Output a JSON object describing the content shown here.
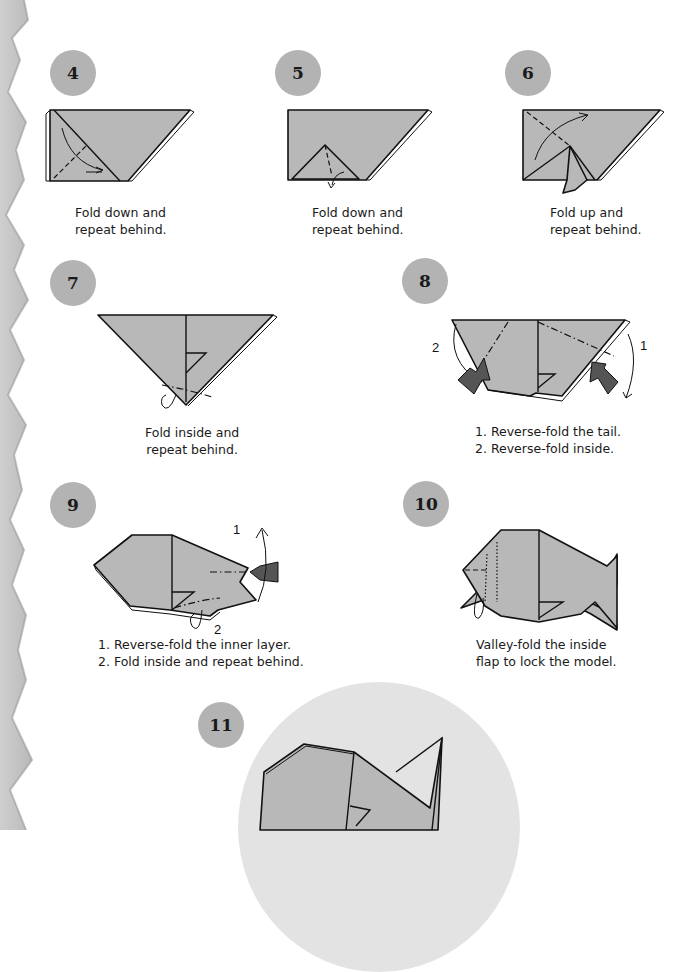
{
  "steps": [
    {
      "number": "4",
      "caption": [
        "Fold down and",
        "repeat behind."
      ]
    },
    {
      "number": "5",
      "caption": [
        "Fold down and",
        "repeat behind."
      ]
    },
    {
      "number": "6",
      "caption": [
        "Fold up and",
        "repeat behind."
      ]
    },
    {
      "number": "7",
      "caption": [
        "Fold inside and",
        "repeat behind."
      ]
    },
    {
      "number": "8",
      "caption": [
        "1. Reverse-fold the tail.",
        "2. Reverse-fold inside."
      ],
      "labels": [
        "1",
        "2"
      ]
    },
    {
      "number": "9",
      "caption": [
        "1. Reverse-fold the inner layer.",
        "2. Fold inside and repeat behind."
      ],
      "labels": [
        "1",
        "2"
      ]
    },
    {
      "number": "10",
      "caption": [
        "Valley-fold the inside",
        "flap to lock the model."
      ]
    },
    {
      "number": "11"
    }
  ],
  "colors": {
    "badge": "#b3b3b3",
    "paper": "#b8b8b8",
    "edge": "#c4c4c4",
    "final_bg": "#e3e3e3"
  }
}
